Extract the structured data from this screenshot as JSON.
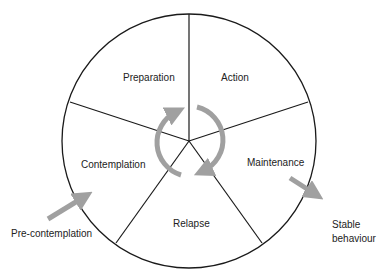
{
  "diagram": {
    "stages": [
      {
        "label": "Preparation"
      },
      {
        "label": "Action"
      },
      {
        "label": "Maintenance"
      },
      {
        "label": "Relapse"
      },
      {
        "label": "Contemplation"
      }
    ],
    "entry": {
      "label": "Pre-contemplation"
    },
    "exit": {
      "label_line1": "Stable",
      "label_line2": "behaviour"
    },
    "colors": {
      "line": "#1a1a1a",
      "arrow": "#a0a0a0"
    }
  }
}
